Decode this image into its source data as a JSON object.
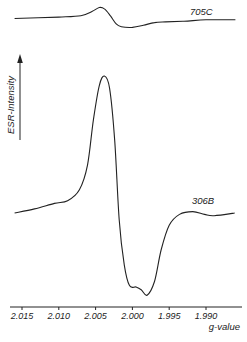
{
  "chart_data": {
    "type": "line",
    "title": "",
    "xlabel": "g-value",
    "ylabel": "ESR-Intensity",
    "x_reversed": true,
    "xlim": [
      2.0166,
      1.9851
    ],
    "xticks": [
      2.015,
      2.01,
      2.005,
      2.0,
      1.995,
      1.99
    ],
    "xtick_labels": [
      "2.015",
      "2.010",
      "2.005",
      "2.000",
      "1.995",
      "1.990"
    ],
    "grid": false,
    "y_units": "arbitrary",
    "series": [
      {
        "name": "705C",
        "offset": 1.42,
        "points": [
          [
            2.016,
            0.0
          ],
          [
            2.01,
            0.01
          ],
          [
            2.007,
            0.02
          ],
          [
            2.0055,
            0.05
          ],
          [
            2.0045,
            0.08
          ],
          [
            2.0038,
            0.07
          ],
          [
            2.003,
            0.02
          ],
          [
            2.0022,
            -0.04
          ],
          [
            2.0015,
            -0.06
          ],
          [
            2.0,
            -0.065
          ],
          [
            1.9985,
            -0.05
          ],
          [
            1.997,
            -0.03
          ],
          [
            1.9955,
            -0.025
          ],
          [
            1.993,
            -0.02
          ],
          [
            1.99,
            -0.01
          ],
          [
            1.986,
            -0.01
          ]
        ]
      },
      {
        "name": "306B",
        "offset": 0,
        "points": [
          [
            2.016,
            0.0
          ],
          [
            2.0133,
            0.03
          ],
          [
            2.0106,
            0.07
          ],
          [
            2.0088,
            0.09
          ],
          [
            2.0072,
            0.17
          ],
          [
            2.0061,
            0.35
          ],
          [
            2.0053,
            0.68
          ],
          [
            2.0045,
            0.93
          ],
          [
            2.0038,
            1.0
          ],
          [
            2.0031,
            0.91
          ],
          [
            2.0024,
            0.53
          ],
          [
            2.0018,
            -0.05
          ],
          [
            2.0011,
            -0.38
          ],
          [
            2.0004,
            -0.53
          ],
          [
            1.9995,
            -0.54
          ],
          [
            1.9988,
            -0.56
          ],
          [
            1.998,
            -0.6
          ],
          [
            1.997,
            -0.5
          ],
          [
            1.9961,
            -0.27
          ],
          [
            1.995,
            -0.09
          ],
          [
            1.9936,
            -0.01
          ],
          [
            1.9918,
            0.01
          ],
          [
            1.9902,
            -0.01
          ],
          [
            1.9889,
            -0.02
          ],
          [
            1.9861,
            0.0
          ]
        ]
      }
    ]
  }
}
